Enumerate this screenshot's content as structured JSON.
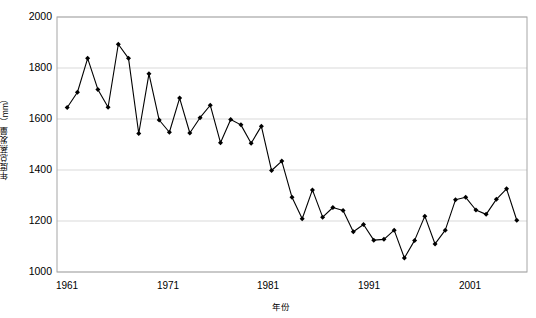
{
  "chart_data": {
    "type": "line",
    "title": "",
    "xlabel": "年份",
    "ylabel": "年度总蒸发量（mm）",
    "xlim": [
      1960,
      2006
    ],
    "ylim": [
      1000,
      2000
    ],
    "xticks": [
      1961,
      1971,
      1981,
      1991,
      2001
    ],
    "yticks": [
      1000,
      1200,
      1400,
      1600,
      1800,
      2000
    ],
    "grid": "horizontal",
    "legend": "none",
    "marker": "diamond",
    "line_color": "#000000",
    "marker_color": "#000000",
    "frame_color": "#a6a6a6",
    "grid_color": "#d9d9d9",
    "background": "#ffffff",
    "x": [
      1961,
      1962,
      1963,
      1964,
      1965,
      1966,
      1967,
      1968,
      1969,
      1970,
      1971,
      1972,
      1973,
      1974,
      1975,
      1976,
      1977,
      1978,
      1979,
      1980,
      1981,
      1982,
      1983,
      1984,
      1985,
      1986,
      1987,
      1988,
      1989,
      1990,
      1991,
      1992,
      1993,
      1994,
      1995,
      1996,
      1997,
      1998,
      1999,
      2000,
      2001,
      2002,
      2003,
      2004,
      2005
    ],
    "values": [
      1645,
      1705,
      1838,
      1716,
      1646,
      1893,
      1838,
      1543,
      1777,
      1596,
      1548,
      1682,
      1545,
      1605,
      1654,
      1507,
      1598,
      1577,
      1505,
      1572,
      1398,
      1435,
      1293,
      1209,
      1322,
      1215,
      1253,
      1241,
      1158,
      1186,
      1125,
      1128,
      1164,
      1055,
      1124,
      1219,
      1110,
      1164,
      1283,
      1293,
      1243,
      1226,
      1285,
      1326,
      1203
    ]
  },
  "axis": {
    "y_tick_labels": [
      "2000",
      "1800",
      "1600",
      "1400",
      "1200",
      "1000"
    ],
    "x_tick_labels": [
      "1961",
      "1971",
      "1981",
      "1991",
      "2001"
    ]
  }
}
